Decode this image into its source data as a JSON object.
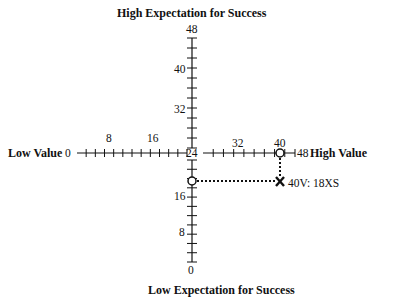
{
  "diagram": {
    "title_top": "High Expectation for Success",
    "title_bottom": "Low Expectation for Success",
    "label_left": "Low Value",
    "label_right": "High Value",
    "horizontal_axis": {
      "min": 0,
      "max": 48,
      "center": 24,
      "labels": [
        "0",
        "8",
        "16",
        "24",
        "32",
        "40",
        "48"
      ]
    },
    "vertical_axis": {
      "min": 0,
      "max": 48,
      "labels": [
        "48",
        "40",
        "32",
        "16",
        "8",
        "0"
      ]
    },
    "point": {
      "value": 40,
      "expectation": 18,
      "label": "40V: 18XS",
      "marker": "x-mark"
    },
    "projections": [
      {
        "axis": "horizontal",
        "value": 40
      },
      {
        "axis": "vertical",
        "value": 18
      }
    ]
  }
}
